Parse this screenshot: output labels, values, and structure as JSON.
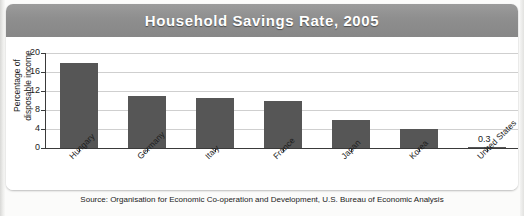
{
  "header": {
    "title": "Household Savings Rate, 2005"
  },
  "source": {
    "text": "Source: Organisation for Economic Co-operation and Development, U.S. Bureau of Economic Analysis"
  },
  "colors": {
    "title_bar": "#8e8e8e",
    "bar_fill": "#565656",
    "gridline": "#cfcfcf",
    "axis": "#3a3a3a",
    "card_background": "#ffffff",
    "page_background": "#fbfbfa",
    "title_text": "#ffffff"
  },
  "chart_data": {
    "type": "bar",
    "title": "Household Savings Rate, 2005",
    "xlabel": "",
    "ylabel": "Percentage of\ndisposable income",
    "categories": [
      "Hungary",
      "Germany",
      "Italy",
      "France",
      "Japan",
      "Korea",
      "United States"
    ],
    "values": [
      18.0,
      11.0,
      10.5,
      10.0,
      6.0,
      4.0,
      0.3
    ],
    "data_labels": [
      "",
      "",
      "",
      "",
      "",
      "",
      "0.3"
    ],
    "ylim": [
      0,
      20
    ],
    "yticks": [
      0,
      4,
      8,
      12,
      16,
      20
    ],
    "ytick_labels": [
      "0",
      "4",
      "8",
      "12",
      "16",
      "20"
    ],
    "grid": true,
    "grid_axis": "y",
    "legend": false,
    "legend_position": "none",
    "orientation": "vertical",
    "xtick_label_rotation": -45
  }
}
